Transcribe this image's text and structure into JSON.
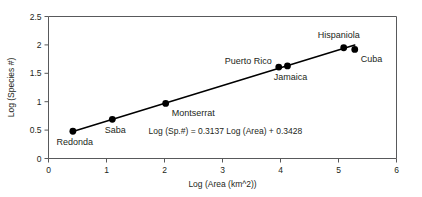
{
  "chart_data": {
    "type": "scatter",
    "title": "",
    "xlabel": "Log (Area (km^2))",
    "ylabel": "Log (Species #)",
    "xlim": [
      0,
      6
    ],
    "ylim": [
      0,
      2.5
    ],
    "grid": false,
    "legend": "none",
    "xticks": [
      "0",
      "1",
      "2",
      "3",
      "4",
      "5",
      "6"
    ],
    "xtick_values": [
      0,
      1,
      2,
      3,
      4,
      5,
      6
    ],
    "yticks": [
      "0",
      "0.5",
      "1",
      "1.5",
      "2",
      "2.5"
    ],
    "ytick_values": [
      0,
      0.5,
      1,
      1.5,
      2,
      2.5
    ],
    "points": [
      {
        "label": "Redonda",
        "x": 0.42,
        "y": 0.48,
        "label_dx": 2,
        "label_dy": 14,
        "label_anchor": "middle"
      },
      {
        "label": "Saba",
        "x": 1.1,
        "y": 0.69,
        "label_dx": 3,
        "label_dy": 14,
        "label_anchor": "middle"
      },
      {
        "label": "Montserrat",
        "x": 2.02,
        "y": 0.97,
        "label_dx": 6,
        "label_dy": 13,
        "label_anchor": "start"
      },
      {
        "label": "Puerto Rico",
        "x": 3.97,
        "y": 1.61,
        "label_dx": -7,
        "label_dy": -3,
        "label_anchor": "end"
      },
      {
        "label": "Jamaica",
        "x": 4.12,
        "y": 1.63,
        "label_dx": 3,
        "label_dy": 14,
        "label_anchor": "middle"
      },
      {
        "label": "Hispaniola",
        "x": 5.09,
        "y": 1.95,
        "label_dx": -5,
        "label_dy": -10,
        "label_anchor": "middle"
      },
      {
        "label": "Cuba",
        "x": 5.28,
        "y": 1.92,
        "label_dx": 6,
        "label_dy": 13,
        "label_anchor": "start"
      }
    ],
    "fit_line": {
      "slope": 0.3137,
      "intercept": 0.3428,
      "x_start": 0.42,
      "x_end": 5.28
    },
    "annotations": [
      {
        "name": "regression-equation",
        "text": "Log (Sp.#) = 0.3137 Log (Area) + 0.3428",
        "x": 3.05,
        "y": 0.44
      }
    ],
    "colors": {
      "point": "#000000",
      "line": "#000000",
      "axis": "#58595b",
      "text": "#231f20",
      "background": "#ffffff"
    }
  }
}
